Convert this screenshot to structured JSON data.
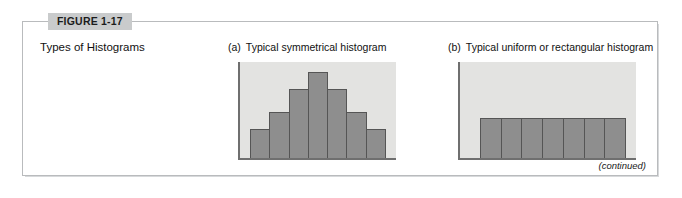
{
  "figure": {
    "tag_label": "FIGURE 1-17",
    "caption": "Types of Histograms",
    "continued_note": "(continued)",
    "border_color": "#b9bbbd",
    "tag_background": "#c9cbcc"
  },
  "panels": [
    {
      "letter": "(a)",
      "title": "Typical symmetrical histogram"
    },
    {
      "letter": "(b)",
      "title": "Typical uniform or rectangular histogram"
    }
  ],
  "chart_data": [
    {
      "type": "bar",
      "title": "Typical symmetrical histogram",
      "panel": "(a)",
      "categories": [
        "1",
        "2",
        "3",
        "4",
        "5",
        "6",
        "7"
      ],
      "values": [
        30,
        48,
        72,
        90,
        72,
        48,
        30
      ],
      "xlabel": "",
      "ylabel": "",
      "ylim": [
        0,
        100
      ],
      "grid": false,
      "legend": "none",
      "bar_color": "#8e8e8e",
      "bar_border_color": "#555555",
      "plot_background": "#e3e3e1",
      "axis_color": "#6f6f6f",
      "tick_labels_visible": false
    },
    {
      "type": "bar",
      "title": "Typical uniform or rectangular histogram",
      "panel": "(b)",
      "categories": [
        "1",
        "2",
        "3",
        "4",
        "5",
        "6",
        "7"
      ],
      "values": [
        42,
        42,
        42,
        42,
        42,
        42,
        42
      ],
      "xlabel": "",
      "ylabel": "",
      "ylim": [
        0,
        100
      ],
      "grid": false,
      "legend": "none",
      "bar_color": "#8e8e8e",
      "bar_border_color": "#555555",
      "plot_background": "#e3e3e1",
      "axis_color": "#6f6f6f",
      "tick_labels_visible": false
    }
  ]
}
